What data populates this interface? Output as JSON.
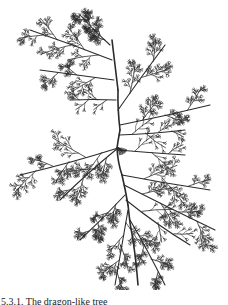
{
  "figure": {
    "type": "branching-tree-illustration",
    "stroke_color": "#2a2a2a",
    "background": "#ffffff",
    "trunk": [
      [
        112,
        40
      ],
      [
        118,
        90
      ],
      [
        120,
        130
      ],
      [
        117,
        148
      ],
      [
        122,
        175
      ],
      [
        128,
        205
      ],
      [
        133,
        240
      ],
      [
        138,
        285
      ]
    ],
    "hub": [
      118,
      148
    ],
    "branches": [
      {
        "from": [
          112,
          60
        ],
        "to": [
          30,
          30
        ],
        "depth": 3
      },
      {
        "from": [
          114,
          80
        ],
        "to": [
          40,
          70
        ],
        "depth": 3
      },
      {
        "from": [
          116,
          100
        ],
        "to": [
          70,
          100
        ],
        "depth": 2
      },
      {
        "from": [
          110,
          45
        ],
        "to": [
          80,
          15
        ],
        "depth": 3
      },
      {
        "from": [
          118,
          110
        ],
        "to": [
          165,
          45
        ],
        "depth": 3
      },
      {
        "from": [
          120,
          125
        ],
        "to": [
          210,
          105
        ],
        "depth": 3
      },
      {
        "from": [
          119,
          135
        ],
        "to": [
          185,
          130
        ],
        "depth": 2
      },
      {
        "from": [
          118,
          148
        ],
        "to": [
          20,
          175
        ],
        "depth": 3
      },
      {
        "from": [
          118,
          148
        ],
        "to": [
          60,
          200
        ],
        "depth": 3
      },
      {
        "from": [
          118,
          150
        ],
        "to": [
          185,
          155
        ],
        "depth": 2
      },
      {
        "from": [
          122,
          175
        ],
        "to": [
          210,
          190
        ],
        "depth": 3
      },
      {
        "from": [
          124,
          185
        ],
        "to": [
          215,
          230
        ],
        "depth": 3
      },
      {
        "from": [
          125,
          195
        ],
        "to": [
          80,
          240
        ],
        "depth": 3
      },
      {
        "from": [
          128,
          210
        ],
        "to": [
          115,
          285
        ],
        "depth": 3
      },
      {
        "from": [
          130,
          220
        ],
        "to": [
          165,
          285
        ],
        "depth": 3
      },
      {
        "from": [
          126,
          200
        ],
        "to": [
          190,
          245
        ],
        "depth": 2
      }
    ]
  },
  "caption": {
    "text": "5.3.1. The dragon-like tree"
  }
}
